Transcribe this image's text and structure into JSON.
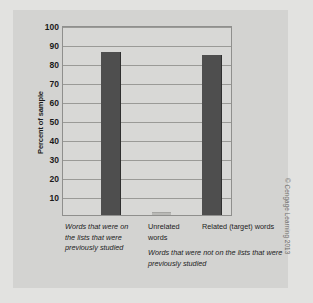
{
  "figure": {
    "credit": "© Cengage Learning 2013",
    "sub_caption": "Words that were not on the lists that were previously studied"
  },
  "chart_data": {
    "type": "bar",
    "title": "",
    "xlabel": "",
    "ylabel": "Percent of sample",
    "ylim": [
      0,
      100
    ],
    "yticks": [
      10,
      20,
      30,
      40,
      50,
      60,
      70,
      80,
      90,
      100
    ],
    "ytick_labels": [
      "10",
      "20",
      "30",
      "40",
      "50",
      "60",
      "70",
      "80",
      "90",
      "100"
    ],
    "grid": true,
    "legend": "none",
    "categories": [
      "Words that were on the lists that were previously studied",
      "Unrelated words",
      "Related (target) words"
    ],
    "values": [
      86,
      1,
      84
    ],
    "bar_color": "#4e4e4e",
    "annotations": [
      "Words that were not on the lists that were previously studied"
    ]
  }
}
